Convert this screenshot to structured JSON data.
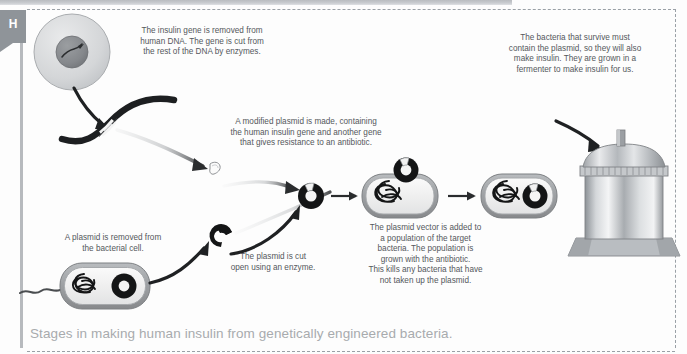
{
  "page": {
    "tab_label": "H",
    "caption": "Stages in making human insulin from genetically engineered bacteria."
  },
  "notes": {
    "insulin_gene": "The insulin gene is removed from\nhuman DNA. The gene is cut from\nthe rest of the DNA by enzymes.",
    "modified_plasmid": "A modified plasmid is made, containing\nthe human insulin gene and another gene\nthat gives resistance to an antibiotic.",
    "bacteria_survive": "The bacteria that survive must\ncontain the plasmid, so they will also\nmake insulin. They are grown in a\nfermenter to make insulin for us.",
    "plasmid_removed": "A plasmid is removed from\nthe bacterial cell.",
    "plasmid_cut": "The plasmid is cut\nopen using an enzyme.",
    "plasmid_vector": "The plasmid vector is added to\na population of the target\nbacteria. The population is\ngrown with the antibiotic.\nThis kills any bacteria that have\nnot taken up the plasmid."
  },
  "figures": {
    "human_cell": "human-cell-with-nucleus",
    "dna_strand": "cut-dna-strand-with-insulin-gene",
    "gene_fragment": "isolated-insulin-gene-fragment",
    "cut_plasmid": "cut-open-plasmid",
    "bacterial_cell_source": "bacterial-cell-with-plasmid",
    "recombinant_plasmid": "recombinant-plasmid-vector",
    "target_bacterium": "target-bacterium-uptaking-plasmid",
    "transformed_bacterium": "transformed-bacterium-with-plasmid",
    "fermenter": "industrial-fermenter-vessel"
  },
  "colors": {
    "ink": "#54585c",
    "caption": "#a8abae",
    "rule": "#b7babe",
    "tab": "#8f9499",
    "dash": "#9aa0a6",
    "dna_dark": "#1c1c1c",
    "cell_fill": "#d3d5d7",
    "cell_outline": "#9a9da0",
    "metal_light": "#e6e7e9",
    "metal_dark": "#6f7479"
  }
}
